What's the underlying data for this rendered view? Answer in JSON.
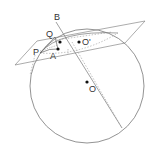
{
  "diagram": {
    "type": "geometry-sphere-plane",
    "colors": {
      "line": "#777777",
      "dashed": "#999999",
      "point": "#111111",
      "label": "#333333"
    },
    "labels": {
      "B": "B",
      "Q": "Q",
      "P": "P",
      "A": "A",
      "O_prime": "O'",
      "O": "O"
    }
  }
}
